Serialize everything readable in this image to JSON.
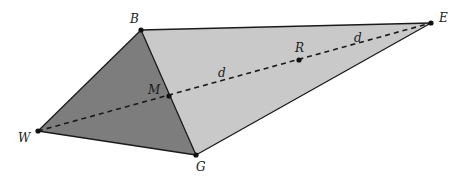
{
  "diagram": {
    "type": "geometry-figure",
    "colors": {
      "background": "#ffffff",
      "dark_face": "#7d7d7d",
      "light_face": "#c9c9c9",
      "stroke": "#1a1a1a"
    },
    "points": {
      "B": {
        "label": "B",
        "x": 141,
        "y": 30
      },
      "E": {
        "label": "E",
        "x": 431,
        "y": 23
      },
      "W": {
        "label": "W",
        "x": 38,
        "y": 131
      },
      "G": {
        "label": "G",
        "x": 196,
        "y": 155
      },
      "M": {
        "label": "M",
        "x": 169,
        "y": 96
      },
      "R": {
        "label": "R",
        "x": 299,
        "y": 60
      }
    },
    "faces": [
      {
        "name": "triangle-WBG",
        "vertices": [
          "W",
          "B",
          "G"
        ],
        "shade": "dark"
      },
      {
        "name": "triangle-BEG",
        "vertices": [
          "B",
          "E",
          "G"
        ],
        "shade": "light"
      }
    ],
    "edges": [
      [
        "W",
        "B"
      ],
      [
        "B",
        "E"
      ],
      [
        "E",
        "G"
      ],
      [
        "G",
        "W"
      ],
      [
        "B",
        "G"
      ]
    ],
    "dashed_segment": [
      "W",
      "M",
      "R",
      "E"
    ],
    "segment_labels": [
      {
        "text": "d",
        "x": 219,
        "y": 76,
        "between": [
          "M",
          "R"
        ]
      },
      {
        "text": "d",
        "x": 355,
        "y": 42,
        "between": [
          "R",
          "E"
        ]
      }
    ],
    "vertex_labels": {
      "B": "B",
      "E": "E",
      "W": "W",
      "G": "G",
      "M": "M",
      "R": "R"
    }
  }
}
